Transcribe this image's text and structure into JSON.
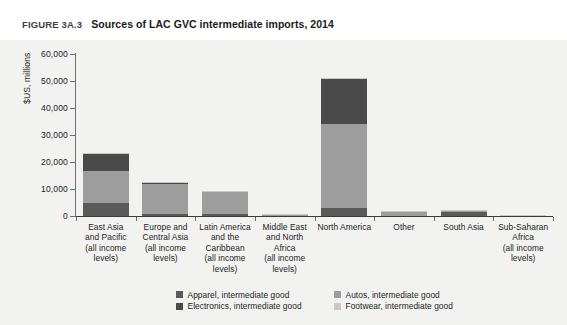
{
  "figure": {
    "number": "FIGURE 3A.3",
    "title": "Sources of LAC GVC intermediate imports, 2014"
  },
  "chart_data": {
    "type": "bar",
    "stacked": true,
    "title": "Sources of LAC GVC intermediate imports, 2014",
    "xlabel": "",
    "ylabel": "$US, millions",
    "ylim": [
      0,
      60000
    ],
    "yticks": [
      0,
      10000,
      20000,
      30000,
      40000,
      50000,
      60000
    ],
    "ytick_labels": [
      "0",
      "10,000",
      "20,000",
      "30,000",
      "40,000",
      "50,000",
      "60,000"
    ],
    "grid": false,
    "legend_position": "bottom",
    "categories": [
      "East Asia and Pacific (all income levels)",
      "Europe and Central Asia (all income levels)",
      "Latin America and the Caribbean (all income levels)",
      "Middle East and North Africa (all income levels)",
      "North America",
      "Other",
      "South Asia",
      "Sub-Saharan Africa (all income levels)"
    ],
    "category_lines": [
      [
        "East Asia",
        "and Pacific",
        "(all income",
        "levels)"
      ],
      [
        "Europe and",
        "Central Asia",
        "(all income",
        "levels)"
      ],
      [
        "Latin America",
        "and the",
        "Caribbean",
        "(all income",
        "levels)"
      ],
      [
        "Middle East",
        "and North",
        "Africa",
        "(all income",
        "levels)"
      ],
      [
        "North America"
      ],
      [
        "Other"
      ],
      [
        "South Asia"
      ],
      [
        "Sub-Saharan",
        "Africa",
        "(all income",
        "levels)"
      ]
    ],
    "series": [
      {
        "name": "Apparel, intermediate good",
        "color": "#5a5a5a",
        "values": [
          4900,
          600,
          900,
          120,
          2900,
          100,
          1400,
          60
        ]
      },
      {
        "name": "Autos, intermediate good",
        "color": "#9d9d9d",
        "values": [
          11900,
          11500,
          7900,
          350,
          31000,
          1400,
          400,
          80
        ]
      },
      {
        "name": "Electronics, intermediate good",
        "color": "#4a4a4a",
        "values": [
          6200,
          200,
          200,
          60,
          17000,
          150,
          100,
          40
        ]
      },
      {
        "name": "Footwear, intermediate good",
        "color": "#c9c9c9",
        "values": [
          250,
          200,
          120,
          30,
          300,
          80,
          60,
          30
        ]
      }
    ],
    "totals": [
      23250,
      12500,
      9120,
      560,
      51200,
      1730,
      1960,
      210
    ]
  },
  "legend": {
    "items": [
      {
        "label": "Apparel, intermediate good",
        "color": "#5a5a5a"
      },
      {
        "label": "Autos, intermediate good",
        "color": "#9d9d9d"
      },
      {
        "label": "Electronics, intermediate good",
        "color": "#4a4a4a"
      },
      {
        "label": "Footwear, intermediate good",
        "color": "#c9c9c9"
      }
    ]
  }
}
